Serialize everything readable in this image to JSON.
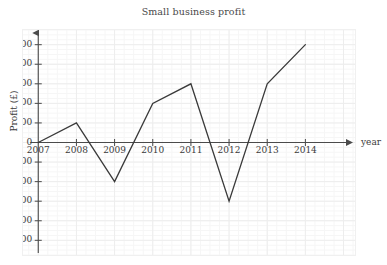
{
  "chart_data": {
    "type": "line",
    "title": "Small business profit",
    "xlabel": "year",
    "ylabel": "Profit (£)",
    "categories": [
      2007,
      2008,
      2009,
      2010,
      2011,
      2012,
      2013,
      2014
    ],
    "x_tick_labels": [
      "2007",
      "2008",
      "2009",
      "2010",
      "2011",
      "2012",
      "2013",
      "2014"
    ],
    "values": [
      0,
      2000,
      -4000,
      4000,
      6000,
      -6000,
      6000,
      10000
    ],
    "series": [
      {
        "name": "Profit",
        "values": [
          0,
          2000,
          -4000,
          4000,
          6000,
          -6000,
          6000,
          10000
        ],
        "color": "#3a3a3a"
      }
    ],
    "y_tick_labels": [
      "10000",
      "8000",
      "6000",
      "4000",
      "2000",
      "0",
      "−2000",
      "−4000",
      "−6000",
      "−8000",
      "−10000"
    ],
    "y_tick_values": [
      10000,
      8000,
      6000,
      4000,
      2000,
      0,
      -2000,
      -4000,
      -6000,
      -8000,
      -10000
    ],
    "ylim": [
      -11500,
      11500
    ],
    "xlim": [
      2006.6,
      2015.3
    ],
    "grid": true,
    "minor_grid": true,
    "legend": "none",
    "axis_arrows": true,
    "line_color": "#3a3a3a",
    "grid_color": "#ededed",
    "minor_grid_color": "#f6f6f6",
    "axis_color": "#4b4b4b",
    "text_color": "#3b3b3b",
    "background": "#ffffff"
  }
}
